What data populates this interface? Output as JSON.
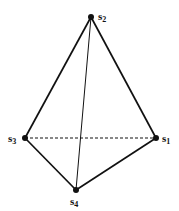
{
  "diagram": {
    "type": "tetrahedron",
    "vertices": [
      {
        "id": "s1",
        "base": "s",
        "sub": "1",
        "x": 156,
        "y": 138,
        "label_x": 162,
        "label_y": 142
      },
      {
        "id": "s2",
        "base": "s",
        "sub": "2",
        "x": 91,
        "y": 17,
        "label_x": 98,
        "label_y": 20
      },
      {
        "id": "s3",
        "base": "s",
        "sub": "3",
        "x": 25,
        "y": 138,
        "label_x": 8,
        "label_y": 142
      },
      {
        "id": "s4",
        "base": "s",
        "sub": "4",
        "x": 76,
        "y": 190,
        "label_x": 70,
        "label_y": 205
      }
    ],
    "edges": [
      {
        "from": "s2",
        "to": "s1",
        "style": "solid"
      },
      {
        "from": "s2",
        "to": "s3",
        "style": "solid"
      },
      {
        "from": "s3",
        "to": "s4",
        "style": "solid"
      },
      {
        "from": "s4",
        "to": "s1",
        "style": "solid"
      },
      {
        "from": "s2",
        "to": "s4",
        "style": "solid-thin"
      },
      {
        "from": "s3",
        "to": "s1",
        "style": "dashed"
      }
    ],
    "colors": {
      "line": "#111111",
      "background": "#ffffff"
    }
  }
}
